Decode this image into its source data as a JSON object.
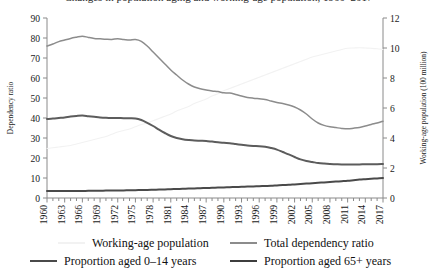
{
  "chart_data": {
    "type": "line",
    "title": "Changes in population aging and working-age population, 1960–2017",
    "xlabel": "",
    "ylabel": "Dependency ratio",
    "y2label": "Working-age population (100 million)",
    "ylim": [
      0,
      90
    ],
    "y2lim": [
      0,
      12
    ],
    "xlim": [
      1960,
      2017
    ],
    "grid": false,
    "legend_position": "bottom",
    "yticks": [
      0,
      10,
      20,
      30,
      40,
      50,
      60,
      70,
      80,
      90
    ],
    "y2ticks": [
      0,
      2,
      4,
      6,
      8,
      10,
      12
    ],
    "xticks": [
      1960,
      1963,
      1966,
      1969,
      1972,
      1975,
      1978,
      1981,
      1984,
      1987,
      1990,
      1993,
      1996,
      1999,
      2002,
      2005,
      2008,
      2011,
      2014,
      2017
    ],
    "x": [
      1960,
      1961,
      1962,
      1963,
      1964,
      1965,
      1966,
      1967,
      1968,
      1969,
      1970,
      1971,
      1972,
      1973,
      1974,
      1975,
      1976,
      1977,
      1978,
      1979,
      1980,
      1981,
      1982,
      1983,
      1984,
      1985,
      1986,
      1987,
      1988,
      1989,
      1990,
      1991,
      1992,
      1993,
      1994,
      1995,
      1996,
      1997,
      1998,
      1999,
      2000,
      2001,
      2002,
      2003,
      2004,
      2005,
      2006,
      2007,
      2008,
      2009,
      2010,
      2011,
      2012,
      2013,
      2014,
      2015,
      2016,
      2017
    ],
    "series": [
      {
        "name": "Working-age population",
        "axis": "right",
        "color": "#f2f2f2",
        "width": 1.1,
        "values": [
          3.3,
          3.35,
          3.4,
          3.45,
          3.5,
          3.6,
          3.7,
          3.8,
          3.9,
          4.0,
          4.1,
          4.25,
          4.4,
          4.5,
          4.6,
          4.75,
          4.9,
          5.0,
          5.15,
          5.3,
          5.45,
          5.6,
          5.8,
          5.95,
          6.1,
          6.3,
          6.45,
          6.6,
          6.8,
          6.95,
          7.15,
          7.3,
          7.45,
          7.6,
          7.75,
          7.9,
          8.05,
          8.2,
          8.35,
          8.5,
          8.65,
          8.8,
          8.95,
          9.1,
          9.25,
          9.4,
          9.5,
          9.6,
          9.7,
          9.8,
          9.9,
          9.98,
          10.0,
          10.02,
          10.0,
          9.98,
          9.95,
          9.9
        ]
      },
      {
        "name": "Total dependency ratio",
        "axis": "left",
        "color": "#8c8c8c",
        "width": 1.5,
        "values": [
          76.0,
          77.0,
          78.2,
          79.0,
          79.8,
          80.4,
          80.9,
          80.3,
          79.8,
          79.6,
          79.4,
          79.3,
          79.6,
          79.3,
          79.0,
          79.2,
          78.3,
          76.0,
          73.0,
          70.0,
          67.0,
          64.0,
          61.5,
          59.0,
          57.0,
          55.5,
          54.6,
          54.0,
          53.5,
          53.2,
          52.6,
          52.5,
          51.8,
          51.0,
          50.3,
          49.9,
          49.6,
          49.3,
          48.5,
          47.8,
          47.2,
          46.5,
          45.5,
          44.0,
          42.0,
          39.5,
          37.5,
          36.3,
          35.6,
          35.2,
          34.8,
          34.6,
          34.9,
          35.3,
          36.0,
          36.8,
          37.5,
          38.4
        ]
      },
      {
        "name": "Proportion aged 0–14 years",
        "axis": "left",
        "color": "#5c5c5c",
        "width": 2.0,
        "values": [
          39.5,
          39.7,
          40.0,
          40.3,
          40.7,
          41.0,
          41.2,
          40.9,
          40.6,
          40.3,
          40.1,
          40.0,
          40.0,
          39.9,
          39.9,
          39.8,
          39.0,
          37.6,
          36.0,
          34.2,
          32.5,
          31.0,
          30.0,
          29.4,
          29.0,
          28.7,
          28.6,
          28.5,
          28.2,
          27.9,
          27.6,
          27.4,
          27.0,
          26.6,
          26.2,
          26.0,
          25.9,
          25.6,
          25.0,
          24.2,
          23.0,
          21.8,
          20.5,
          19.3,
          18.5,
          18.0,
          17.5,
          17.2,
          17.0,
          16.9,
          16.8,
          16.8,
          16.8,
          16.8,
          16.9,
          16.9,
          16.9,
          17.0
        ]
      },
      {
        "name": "Proportion aged 65+ years",
        "axis": "left",
        "color": "#4a4a4a",
        "width": 2.0,
        "values": [
          3.5,
          3.5,
          3.5,
          3.5,
          3.5,
          3.5,
          3.5,
          3.6,
          3.6,
          3.6,
          3.7,
          3.7,
          3.8,
          3.8,
          3.9,
          3.9,
          4.0,
          4.0,
          4.1,
          4.2,
          4.3,
          4.4,
          4.5,
          4.6,
          4.7,
          4.8,
          4.9,
          5.0,
          5.1,
          5.2,
          5.3,
          5.4,
          5.5,
          5.6,
          5.7,
          5.8,
          5.9,
          6.0,
          6.1,
          6.3,
          6.5,
          6.6,
          6.8,
          7.0,
          7.2,
          7.4,
          7.6,
          7.8,
          8.0,
          8.2,
          8.4,
          8.6,
          8.9,
          9.2,
          9.4,
          9.6,
          9.8,
          10.0
        ]
      }
    ]
  },
  "legend": {
    "items": [
      {
        "label": "Working-age population",
        "color": "#f2f2f2",
        "width": 2
      },
      {
        "label": "Total dependency ratio",
        "color": "#8c8c8c",
        "width": 2
      },
      {
        "label": "Proportion aged 0–14 years",
        "color": "#4a4a4a",
        "width": 2.6
      },
      {
        "label": "Proportion aged 65+ years",
        "color": "#3d3d3d",
        "width": 2.6
      }
    ]
  },
  "axis_color": "#8a8a8a"
}
